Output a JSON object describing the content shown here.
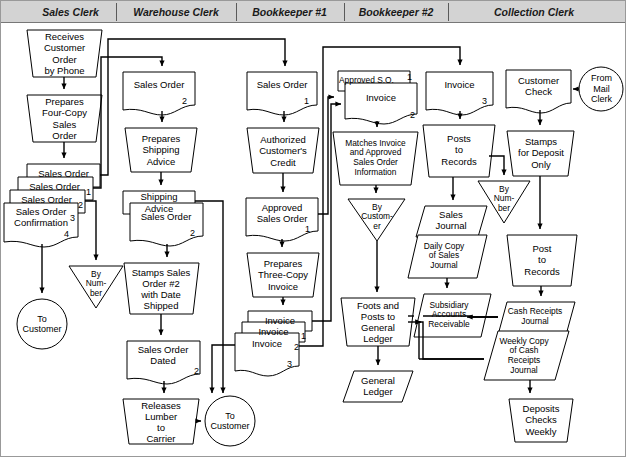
{
  "diagram": {
    "columns": [
      {
        "id": "sales-clerk",
        "label": "Sales Clerk"
      },
      {
        "id": "warehouse-clerk",
        "label": "Warehouse Clerk"
      },
      {
        "id": "bookkeeper-1",
        "label": "Bookkeeper #1"
      },
      {
        "id": "bookkeeper-2",
        "label": "Bookkeeper #2"
      },
      {
        "id": "collection-clerk",
        "label": "Collection Clerk"
      }
    ],
    "colors": {
      "header_bg": "#d3d3d3",
      "header_text": "#1a1a1a",
      "line": "#000000",
      "shape_fill": "#ffffff",
      "shape_stroke": "#000000"
    }
  },
  "nodes": {
    "receives_order": {
      "label": "Receives\nCustomer\nOrder\nby Phone",
      "shape": "manual-operation",
      "column": "sales-clerk"
    },
    "prepares_four_copy": {
      "label": "Prepares\nFour-Copy\nSales\nOrder",
      "shape": "manual-operation",
      "column": "sales-clerk"
    },
    "so_stack_1": {
      "label": "Sales Order",
      "copy": "1",
      "shape": "document",
      "column": "sales-clerk"
    },
    "so_stack_2": {
      "label": "Sales Order",
      "copy": "2",
      "shape": "document",
      "column": "sales-clerk"
    },
    "so_stack_3": {
      "label": "Sales Order",
      "copy": "3",
      "shape": "document",
      "column": "sales-clerk"
    },
    "so_confirmation_4": {
      "label": "Sales Order\nConfirmation",
      "copy": "4",
      "shape": "document",
      "column": "sales-clerk"
    },
    "by_number_sales": {
      "label": "By\nNum-\nber",
      "shape": "file-triangle",
      "column": "sales-clerk"
    },
    "to_customer_sales": {
      "label": "To\nCustomer",
      "shape": "connector-circle",
      "column": "sales-clerk"
    },
    "wh_sales_order_2": {
      "label": "Sales Order",
      "copy": "2",
      "shape": "document",
      "column": "warehouse-clerk"
    },
    "prepares_shipping_advice": {
      "label": "Prepares\nShipping\nAdvice",
      "shape": "manual-operation",
      "column": "warehouse-clerk"
    },
    "shipping_advice": {
      "label": "Shipping\nAdvice",
      "shape": "document",
      "column": "warehouse-clerk"
    },
    "wh_sales_order_2b": {
      "label": "Sales Order",
      "copy": "2",
      "shape": "document",
      "column": "warehouse-clerk"
    },
    "stamps_sales_order": {
      "label": "Stamps Sales\nOrder #2\nwith Date\nShipped",
      "shape": "manual-operation",
      "column": "warehouse-clerk"
    },
    "sales_order_dated": {
      "label": "Sales Order\nDated",
      "copy": "2",
      "shape": "document",
      "column": "warehouse-clerk"
    },
    "releases_lumber": {
      "label": "Releases\nLumber\nto\nCarrier",
      "shape": "manual-operation",
      "column": "warehouse-clerk"
    },
    "to_customer_wh": {
      "label": "To\nCustomer",
      "shape": "connector-circle",
      "column": "warehouse-clerk"
    },
    "bk1_sales_order_1": {
      "label": "Sales Order",
      "copy": "1",
      "shape": "document",
      "column": "bookkeeper-1"
    },
    "authorized_credit": {
      "label": "Authorized\nCustomer's\nCredit",
      "shape": "manual-operation",
      "column": "bookkeeper-1"
    },
    "approved_sales_order": {
      "label": "Approved\nSales Order",
      "copy": "1",
      "shape": "document",
      "column": "bookkeeper-1"
    },
    "prepares_three_copy_invoice": {
      "label": "Prepares\nThree-Copy\nInvoice",
      "shape": "manual-operation",
      "column": "bookkeeper-1"
    },
    "invoice_1": {
      "label": "Invoice",
      "copy": "1",
      "shape": "document",
      "column": "bookkeeper-1"
    },
    "invoice_2": {
      "label": "Invoice",
      "copy": "2",
      "shape": "document",
      "column": "bookkeeper-1"
    },
    "invoice_3": {
      "label": "Invoice",
      "copy": "3",
      "shape": "document",
      "column": "bookkeeper-1"
    },
    "approved_so_1": {
      "label": "Approved S.O.",
      "copy": "1",
      "shape": "document",
      "column": "bookkeeper-2"
    },
    "bk2_invoice_2": {
      "label": "Invoice",
      "copy": "2",
      "shape": "document",
      "column": "bookkeeper-2"
    },
    "matches_invoice": {
      "label": "Matches Invoice\nand Approved\nSales Order\nInformation",
      "shape": "manual-operation",
      "column": "bookkeeper-2"
    },
    "by_customer": {
      "label": "By\nCustom-\ner",
      "shape": "file-triangle",
      "column": "bookkeeper-2"
    },
    "foots_and_posts": {
      "label": "Foots and\nPosts to\nGeneral\nLedger",
      "shape": "manual-operation",
      "column": "bookkeeper-2"
    },
    "general_ledger": {
      "label": "General\nLedger",
      "shape": "parallelogram",
      "column": "bookkeeper-2"
    },
    "cc_invoice_3": {
      "label": "Invoice",
      "copy": "3",
      "shape": "document",
      "column": "collection-clerk"
    },
    "posts_to_records": {
      "label": "Posts\nto\nRecords",
      "shape": "manual-operation",
      "column": "collection-clerk"
    },
    "by_number_cc": {
      "label": "By\nNum-\nber",
      "shape": "file-triangle",
      "column": "collection-clerk"
    },
    "sales_journal": {
      "label": "Sales\nJournal",
      "shape": "parallelogram",
      "column": "collection-clerk"
    },
    "daily_copy_sales_journal": {
      "label": "Daily Copy\nof Sales\nJournal",
      "shape": "parallelogram",
      "column": "collection-clerk"
    },
    "subsidiary_ar": {
      "label": "Subsidiary\nAccounts\nReceivable",
      "shape": "parallelogram",
      "column": "collection-clerk"
    },
    "customer_check": {
      "label": "Customer\nCheck",
      "shape": "document",
      "column": "collection-clerk"
    },
    "from_mail_clerk": {
      "label": "From\nMail\nClerk",
      "shape": "connector-circle",
      "column": "collection-clerk"
    },
    "stamps_for_deposit": {
      "label": "Stamps\nfor Deposit\nOnly",
      "shape": "manual-operation",
      "column": "collection-clerk"
    },
    "post_to_records": {
      "label": "Post\nto\nRecords",
      "shape": "manual-operation",
      "column": "collection-clerk"
    },
    "cash_receipts_journal": {
      "label": "Cash Receipts\nJournal",
      "shape": "parallelogram",
      "column": "collection-clerk"
    },
    "weekly_copy_crj": {
      "label": "Weekly Copy\nof Cash\nReceipts\nJournal",
      "shape": "parallelogram",
      "column": "collection-clerk"
    },
    "deposits_checks_weekly": {
      "label": "Deposits\nChecks\nWeekly",
      "shape": "manual-operation",
      "column": "collection-clerk"
    }
  }
}
